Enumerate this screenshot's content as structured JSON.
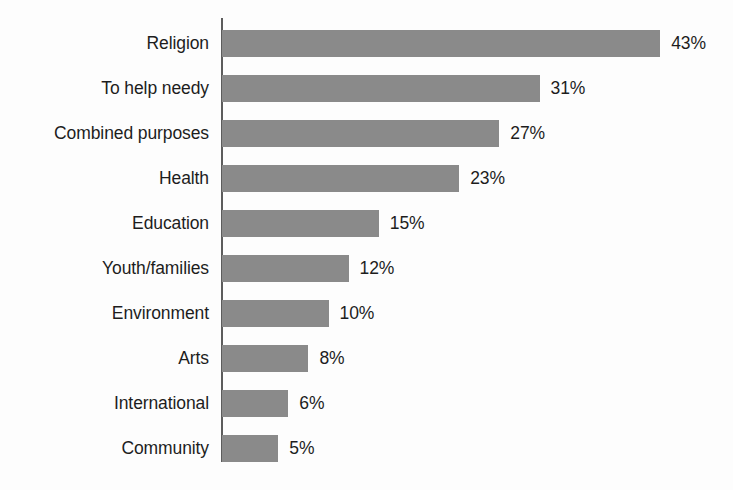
{
  "chart_data": {
    "type": "bar",
    "orientation": "horizontal",
    "title": "",
    "subtitle": "",
    "xlabel": "",
    "ylabel": "",
    "categories": [
      "Religion",
      "To help needy",
      "Combined purposes",
      "Health",
      "Education",
      "Youth/families",
      "Environment",
      "Arts",
      "International",
      "Community"
    ],
    "values": [
      43,
      31,
      27,
      23,
      15,
      12,
      10,
      8,
      6,
      5
    ],
    "value_labels": [
      "43%",
      "31%",
      "27%",
      "23%",
      "15%",
      "12%",
      "10%",
      "8%",
      "6%",
      "5%"
    ],
    "unit": "%",
    "xlim": [
      0,
      43
    ],
    "grid": false,
    "legend": null,
    "bars": [
      {
        "label": "Religion",
        "value": 43,
        "display": "43%"
      },
      {
        "label": "To help needy",
        "value": 31,
        "display": "31%"
      },
      {
        "label": "Combined purposes",
        "value": 27,
        "display": "27%"
      },
      {
        "label": "Health",
        "value": 23,
        "display": "23%"
      },
      {
        "label": "Education",
        "value": 15,
        "display": "15%"
      },
      {
        "label": "Youth/families",
        "value": 12,
        "display": "12%"
      },
      {
        "label": "Environment",
        "value": 10,
        "display": "10%"
      },
      {
        "label": "Arts",
        "value": 8,
        "display": "8%"
      },
      {
        "label": "International",
        "value": 6,
        "display": "6%"
      },
      {
        "label": "Community",
        "value": 5,
        "display": "5%"
      }
    ]
  },
  "style": {
    "bar_color": "#8a8a8a",
    "axis_color": "#5c5c5c",
    "text_color": "#1d1d1d",
    "background": "#fdfdfd"
  },
  "geometry": {
    "axis_x": 221,
    "axis_top": 18,
    "axis_bottom": 462,
    "row_height": 45,
    "first_row_top": 21,
    "bar_height": 27,
    "px_per_unit": 10.05,
    "bar_base_offset": 6
  }
}
